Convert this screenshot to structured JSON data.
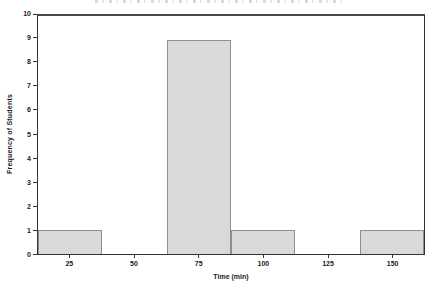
{
  "chart_data": {
    "type": "bar",
    "subtype": "histogram",
    "title": "",
    "xlabel": "Time (min)",
    "ylabel": "Frequency of Students",
    "categories": [
      25,
      50,
      75,
      100,
      125,
      150
    ],
    "x_tick_labels": [
      "25",
      "50",
      "75",
      "100",
      "125",
      "150"
    ],
    "values": [
      1,
      0,
      9,
      1,
      0,
      1
    ],
    "bin_width": 25,
    "xlim": [
      12.5,
      162.5
    ],
    "ylim": [
      0,
      10
    ],
    "y_ticks": [
      0,
      1,
      2,
      3,
      4,
      5,
      6,
      7,
      8,
      9,
      10
    ],
    "grid": false,
    "legend": "none",
    "bar_fill": "#d9d9d9",
    "bar_border": "#8f8f8f",
    "axis_color": "#333333",
    "background": "#ffffff"
  }
}
